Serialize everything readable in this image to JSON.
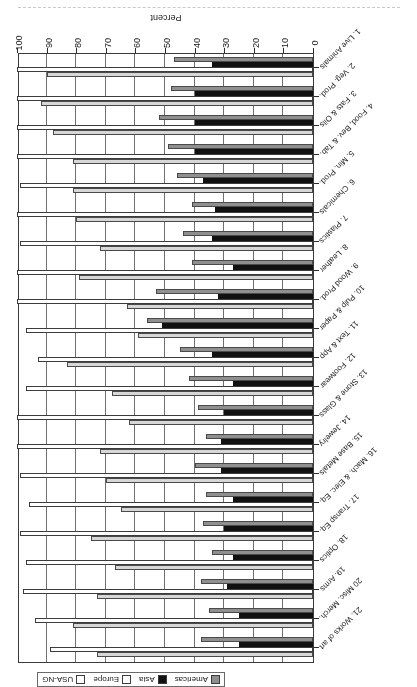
{
  "chart_data": {
    "type": "bar",
    "orientation": "horizontal",
    "title": "",
    "xlabel": "Percent",
    "ylabel": "",
    "xlim": [
      0,
      100
    ],
    "xticks": [
      0,
      10,
      20,
      30,
      40,
      50,
      60,
      70,
      80,
      90,
      100
    ],
    "xticklabels": [
      "0",
      "10",
      "20",
      "30",
      "40",
      "50",
      "60",
      "70",
      "80",
      "90",
      "100"
    ],
    "grid": true,
    "legend_position": "upper right",
    "categories": [
      "1. Live Animals",
      "2. Veg. Prod.",
      "3. Fats & Oils",
      "4. Food, Bev. & Tab.",
      "5. Min. Prod.",
      "6. Chemicals",
      "7. Plastics",
      "8. Leather",
      "9. Wood Prod.",
      "10. Pulp & Paper",
      "11. Text & App",
      "12. Footwear",
      "13. Stone & Glass",
      "14. Jewelry",
      "15. Base Metals",
      "16. Mach. & Elec. Eq.",
      "17. Transp Eq.",
      "18. Optics",
      "19. Arms",
      "20 Misc. Merch.",
      "21. Works of art"
    ],
    "series": [
      {
        "name": "Americas",
        "color": "#8f8f8f",
        "values": [
          47,
          48,
          52,
          49,
          46,
          41,
          44,
          41,
          53,
          56,
          45,
          42,
          39,
          36,
          40,
          36,
          37,
          34,
          38,
          35,
          38
        ]
      },
      {
        "name": "Asia",
        "color": "#111111",
        "values": [
          34,
          40,
          40,
          40,
          37,
          33,
          34,
          27,
          32,
          51,
          34,
          27,
          30,
          31,
          31,
          27,
          30,
          27,
          29,
          25,
          25
        ]
      },
      {
        "name": "Europe",
        "color": "#ffffff",
        "values": [
          100,
          100,
          100,
          100,
          99,
          100,
          99,
          100,
          100,
          97,
          93,
          97,
          100,
          100,
          99,
          96,
          99,
          97,
          98,
          94,
          89
        ]
      },
      {
        "name": "USA-NG",
        "color": "#d7d7d7",
        "values": [
          90,
          92,
          88,
          81,
          81,
          80,
          72,
          79,
          63,
          59,
          83,
          68,
          62,
          72,
          70,
          65,
          75,
          67,
          73,
          81,
          73
        ]
      }
    ]
  },
  "legend": {
    "items": [
      {
        "label": "Americas",
        "swatch": "#8f8f8f"
      },
      {
        "label": "Asia",
        "swatch": "#111111"
      },
      {
        "label": "Europe",
        "swatch": "#ffffff"
      },
      {
        "label": "USA-NG",
        "swatch": "#ffffff"
      }
    ]
  },
  "axis": {
    "value_axis_title": "Percent"
  }
}
